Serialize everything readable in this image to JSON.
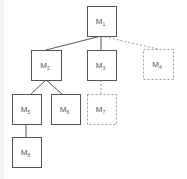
{
  "diagram": {
    "type": "tree",
    "colors": {
      "line": "#555555",
      "dashed": "#999999",
      "label": "#555555",
      "background": "#ffffff"
    },
    "nodes": [
      {
        "id": "M1",
        "base": "M",
        "sub": "1",
        "x": 87,
        "y": 6,
        "w": 29,
        "h": 30,
        "style": "solid"
      },
      {
        "id": "M2",
        "base": "M",
        "sub": "2",
        "x": 31,
        "y": 50,
        "w": 30,
        "h": 30,
        "style": "solid"
      },
      {
        "id": "M3",
        "base": "M",
        "sub": "3",
        "x": 87,
        "y": 50,
        "w": 29,
        "h": 30,
        "style": "solid"
      },
      {
        "id": "M4",
        "base": "M",
        "sub": "4",
        "x": 143,
        "y": 49,
        "w": 30,
        "h": 30,
        "style": "dashed"
      },
      {
        "id": "M5",
        "base": "M",
        "sub": "5",
        "x": 12,
        "y": 94,
        "w": 29,
        "h": 30,
        "style": "solid"
      },
      {
        "id": "M6",
        "base": "M",
        "sub": "6",
        "x": 51,
        "y": 94,
        "w": 29,
        "h": 30,
        "style": "solid"
      },
      {
        "id": "M7",
        "base": "M",
        "sub": "7",
        "x": 87,
        "y": 94,
        "w": 29,
        "h": 30,
        "style": "dashed"
      },
      {
        "id": "M8",
        "base": "M",
        "sub": "8",
        "x": 12,
        "y": 137,
        "w": 29,
        "h": 30,
        "style": "solid"
      }
    ],
    "edges": [
      {
        "from": "M1",
        "to": "M2",
        "x1": 101,
        "y1": 36,
        "x2": 46,
        "y2": 50,
        "style": "solid"
      },
      {
        "from": "M1",
        "to": "M3",
        "x1": 101,
        "y1": 36,
        "x2": 101,
        "y2": 50,
        "style": "solid"
      },
      {
        "from": "M1",
        "to": "M4",
        "x1": 101,
        "y1": 36,
        "x2": 158,
        "y2": 49,
        "style": "dashed"
      },
      {
        "from": "M2",
        "to": "M5",
        "x1": 46,
        "y1": 80,
        "x2": 31,
        "y2": 94,
        "style": "solid"
      },
      {
        "from": "M2",
        "to": "M6",
        "x1": 46,
        "y1": 80,
        "x2": 62,
        "y2": 94,
        "style": "solid"
      },
      {
        "from": "M3",
        "to": "M7",
        "x1": 101,
        "y1": 80,
        "x2": 101,
        "y2": 94,
        "style": "dashed"
      },
      {
        "from": "M5",
        "to": "M8",
        "x1": 26,
        "y1": 124,
        "x2": 26,
        "y2": 137,
        "style": "solid"
      }
    ]
  }
}
